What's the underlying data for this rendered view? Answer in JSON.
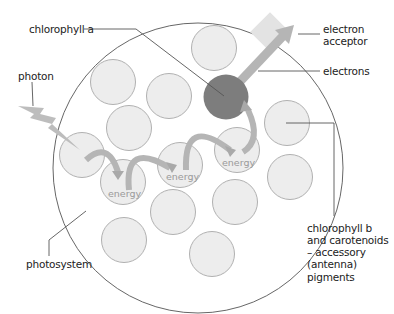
{
  "labels": {
    "chlorophyll_a": "chlorophyll a",
    "photon": "photon",
    "electron_acceptor_line1": "electron",
    "electron_acceptor_line2": "acceptor",
    "electrons": "electrons",
    "accessory_line1": "chlorophyll b",
    "accessory_line2": "and carotenoids",
    "accessory_line3": "– accessory",
    "accessory_line4": "(antenna)",
    "accessory_line5": "pigments",
    "photosystem": "photosystem"
  },
  "energy_labels": [
    "energy",
    "energy",
    "energy"
  ],
  "colors": {
    "photosystem_outline": "#555555",
    "pigment_fill": "#ededed",
    "pigment_stroke": "#a8a8a8",
    "reaction_center": "#7d7d7d",
    "arrow_fill": "#b5b5b5",
    "acceptor_fill": "#e3e3e3",
    "leader_line": "#555555"
  },
  "pigments": [
    {
      "cx": 214,
      "cy": 48
    },
    {
      "cx": 113,
      "cy": 82
    },
    {
      "cx": 169,
      "cy": 95
    },
    {
      "cx": 129,
      "cy": 128
    },
    {
      "cx": 82,
      "cy": 155
    },
    {
      "cx": 123,
      "cy": 182,
      "energy": true
    },
    {
      "cx": 180,
      "cy": 165,
      "energy": true
    },
    {
      "cx": 237,
      "cy": 150,
      "energy": true
    },
    {
      "cx": 287,
      "cy": 123
    },
    {
      "cx": 290,
      "cy": 177
    },
    {
      "cx": 173,
      "cy": 212
    },
    {
      "cx": 235,
      "cy": 202
    },
    {
      "cx": 124,
      "cy": 240
    },
    {
      "cx": 212,
      "cy": 254
    }
  ]
}
